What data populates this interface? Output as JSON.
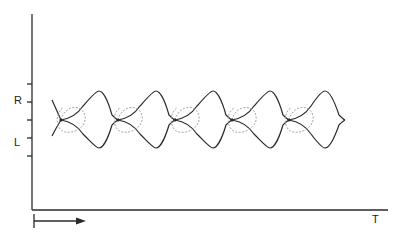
{
  "diagram": {
    "y_axis": {
      "labels": [
        {
          "text": "R",
          "y": 100
        },
        {
          "text": "L",
          "y": 142
        }
      ],
      "ticks_y": [
        84,
        102,
        120,
        138,
        156
      ]
    },
    "x_axis": {
      "label": "T",
      "direction_arrow": "right"
    },
    "nodes_x": [
      61,
      118,
      175,
      232,
      289
    ],
    "lens_peaks_x": [
      99,
      156,
      213,
      270,
      325
    ],
    "center_y": 120,
    "top_y": 91,
    "bottom_y": 148,
    "colors": {
      "line": "#2a2a2a",
      "dashed": "#9a9a9a"
    }
  }
}
